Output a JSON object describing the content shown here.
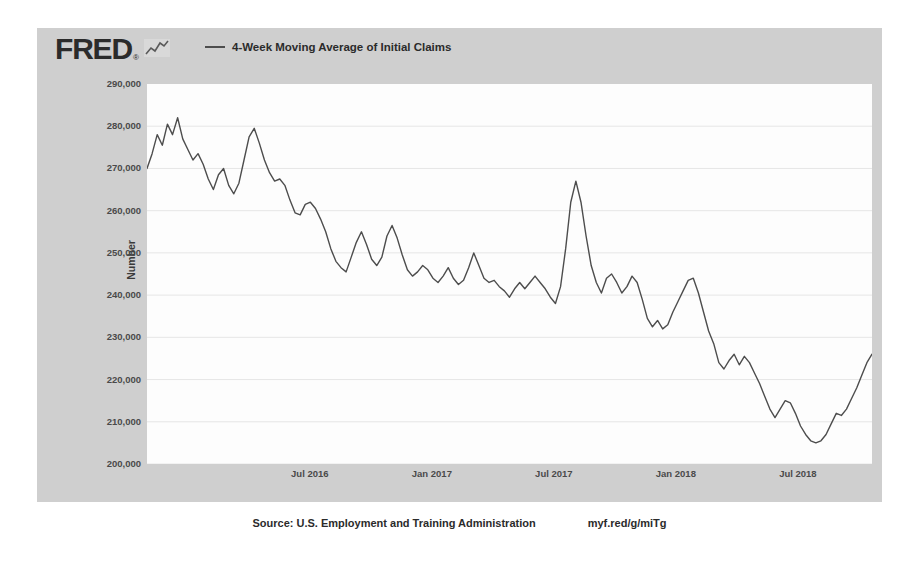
{
  "brand": {
    "wordmark": "FRED",
    "registered_mark": "®",
    "spark_icon": "sparkline-icon"
  },
  "legend": {
    "entries": [
      {
        "label": "4-Week Moving Average of Initial Claims",
        "color": "#4d4d4d"
      }
    ]
  },
  "footer": {
    "source": "Source: U.S. Employment and Training Administration",
    "shortlink": "myf.red/g/miTg"
  },
  "colors": {
    "card_background": "#cfcfcf",
    "plot_background": "#fdfdfd",
    "gridline": "#e6e6e6",
    "series_line": "#4d4d4d",
    "text": "#2b2b2b"
  },
  "chart_data": {
    "type": "line",
    "title": "",
    "xlabel": "",
    "ylabel": "Number",
    "ylim": [
      200000,
      290000
    ],
    "ytick_step": 10000,
    "ytick_labels": [
      "290,000",
      "280,000",
      "270,000",
      "260,000",
      "250,000",
      "240,000",
      "230,000",
      "220,000",
      "210,000",
      "200,000"
    ],
    "ytick_values": [
      290000,
      280000,
      270000,
      260000,
      250000,
      240000,
      230000,
      220000,
      210000,
      200000
    ],
    "xtick_labels": [
      "Jul 2016",
      "Jan 2017",
      "Jul 2017",
      "Jan 2018",
      "Jul 2018"
    ],
    "xtick_positions": [
      0.2246,
      0.3929,
      0.5612,
      0.7295,
      0.8978
    ],
    "grid": true,
    "legend_position": "top",
    "series": [
      {
        "name": "4-Week Moving Average of Initial Claims",
        "color": "#4d4d4d",
        "values": [
          270000,
          273500,
          278000,
          275500,
          280500,
          278000,
          282000,
          277000,
          274500,
          272000,
          273500,
          271000,
          267500,
          265000,
          268500,
          270000,
          266000,
          264000,
          266500,
          272000,
          277500,
          279500,
          276000,
          272000,
          269000,
          267000,
          267500,
          266000,
          262500,
          259500,
          259000,
          261500,
          262000,
          260500,
          258000,
          255000,
          251000,
          248000,
          246500,
          245500,
          249000,
          252500,
          255000,
          252000,
          248500,
          247000,
          249000,
          254000,
          256500,
          253500,
          249500,
          246000,
          244500,
          245500,
          247000,
          246000,
          244000,
          243000,
          244500,
          246500,
          244000,
          242500,
          243500,
          246500,
          250000,
          247000,
          244000,
          243000,
          243500,
          242000,
          241000,
          239500,
          241500,
          243000,
          241500,
          243000,
          244500,
          243000,
          241500,
          239500,
          238000,
          242000,
          251000,
          262000,
          267000,
          262000,
          254000,
          247000,
          243000,
          240500,
          244000,
          245000,
          243000,
          240500,
          242000,
          244500,
          243000,
          239000,
          234500,
          232500,
          234000,
          232000,
          233000,
          236000,
          238500,
          241000,
          243500,
          244000,
          240500,
          236000,
          231500,
          228500,
          224000,
          222500,
          224500,
          226000,
          223500,
          225500,
          224000,
          221500,
          219000,
          216000,
          213000,
          211000,
          213000,
          215000,
          214500,
          212000,
          209000,
          207000,
          205500,
          205000,
          205500,
          207000,
          209500,
          212000,
          211500,
          213000,
          215500,
          218000,
          221000,
          224000,
          226000
        ],
        "start_label": "Jan 2016",
        "end_label": "Oct 2018",
        "min_value": 205000,
        "max_value": 282000,
        "last_value": 226000
      }
    ]
  }
}
